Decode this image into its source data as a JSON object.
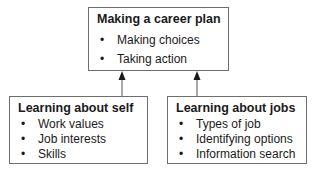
{
  "diagram": {
    "top_box": {
      "title": "Making a career plan",
      "items": [
        "Making choices",
        "Taking action"
      ]
    },
    "left_box": {
      "title": "Learning about self",
      "items": [
        "Work values",
        "Job interests",
        "Skills"
      ]
    },
    "right_box": {
      "title": "Learning about jobs",
      "items": [
        "Types of job",
        "Identifying options",
        "Information search"
      ]
    },
    "connections": [
      {
        "from": "left_box",
        "to": "top_box",
        "type": "arrow"
      },
      {
        "from": "right_box",
        "to": "top_box",
        "type": "arrow"
      }
    ],
    "colors": {
      "border": "#6e6e6e",
      "arrow": "#1a1a1a",
      "text": "#1a1a1a",
      "background": "#ffffff"
    }
  }
}
